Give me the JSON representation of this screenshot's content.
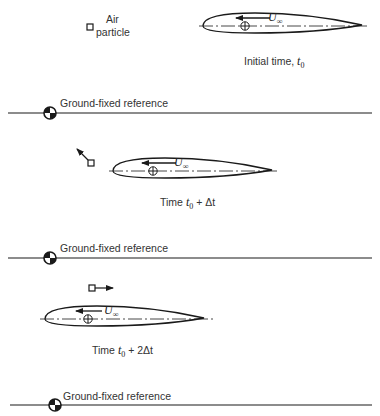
{
  "panels": [
    {
      "caption_prefix": "Initial time, ",
      "caption_var": "t",
      "caption_sub": "0",
      "caption_suffix": "",
      "particle_label_line1": "Air",
      "particle_label_line2": "particle",
      "velocity_label": "U",
      "velocity_sub": "∞",
      "reference_label": "Ground-fixed reference"
    },
    {
      "caption_prefix": "Time ",
      "caption_var": "t",
      "caption_sub": "0",
      "caption_suffix": " + Δt",
      "velocity_label": "U",
      "velocity_sub": "∞",
      "reference_label": "Ground-fixed reference"
    },
    {
      "caption_prefix": "Time ",
      "caption_var": "t",
      "caption_sub": "0",
      "caption_suffix": " + 2Δt",
      "velocity_label": "U",
      "velocity_sub": "∞",
      "reference_label": "Ground-fixed reference"
    }
  ],
  "icons": {
    "reference_marker": "quartered-circle-icon",
    "center_marker": "crosshair-circle-icon",
    "particle": "square-icon"
  },
  "colors": {
    "ink": "#1a1a1a",
    "background": "#ffffff"
  }
}
